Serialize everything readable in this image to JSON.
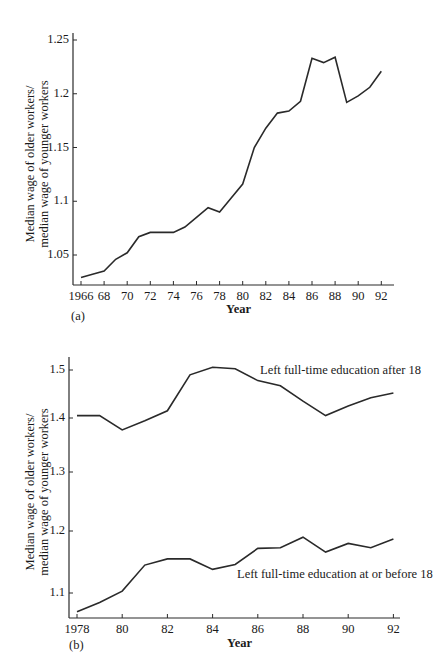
{
  "chart_data": [
    {
      "type": "line",
      "panel": "(a)",
      "title": "",
      "xlabel": "Year",
      "ylabel": "Median wage of older workers/ median wage of younger workers",
      "ylabel_lines": [
        "Median wage of older workers/",
        "median wage of younger workers"
      ],
      "x_ticks": [
        "1966",
        "68",
        "70",
        "72",
        "74",
        "76",
        "78",
        "80",
        "82",
        "84",
        "86",
        "88",
        "90",
        "92"
      ],
      "y_ticks": [
        "1.05",
        "1.1",
        "1.15",
        "1.2",
        "1.25"
      ],
      "xlim": [
        1965.5,
        1992.5
      ],
      "ylim": [
        1.022,
        1.255
      ],
      "grid": false,
      "x": [
        1966,
        1967,
        1968,
        1969,
        1970,
        1971,
        1972,
        1973,
        1974,
        1975,
        1976,
        1977,
        1978,
        1979,
        1980,
        1981,
        1982,
        1983,
        1984,
        1985,
        1986,
        1987,
        1988,
        1989,
        1990,
        1991,
        1992
      ],
      "series": [
        {
          "name": "All workers",
          "values": [
            1.029,
            1.032,
            1.035,
            1.046,
            1.052,
            1.067,
            1.071,
            1.071,
            1.071,
            1.076,
            1.085,
            1.094,
            1.09,
            1.103,
            1.116,
            1.15,
            1.168,
            1.182,
            1.184,
            1.193,
            1.233,
            1.229,
            1.234,
            1.192,
            1.198,
            1.206,
            1.221
          ]
        }
      ]
    },
    {
      "type": "line",
      "panel": "(b)",
      "title": "",
      "xlabel": "Year",
      "ylabel": "Median wage of older workers/ median wage of younger workers",
      "ylabel_lines": [
        "Median wage of older workers/",
        "median wage of younger workers"
      ],
      "x_ticks": [
        "1978",
        "80",
        "82",
        "84",
        "86",
        "88",
        "90",
        "92"
      ],
      "y_ticks": [
        "1.1",
        "1.2",
        "1.3",
        "1.4",
        "1.5"
      ],
      "xlim": [
        1977.8,
        1992.5
      ],
      "ylim": [
        1.06,
        1.52
      ],
      "grid": false,
      "x": [
        1978,
        1979,
        1980,
        1981,
        1982,
        1983,
        1984,
        1985,
        1986,
        1987,
        1988,
        1989,
        1990,
        1991,
        1992
      ],
      "series": [
        {
          "name": "Left full-time education after 18",
          "values": [
            1.405,
            1.405,
            1.378,
            1.395,
            1.415,
            1.49,
            1.506,
            1.503,
            1.478,
            1.467,
            1.435,
            1.405,
            1.425,
            1.442,
            1.452
          ]
        },
        {
          "name": "Left full-time education at or before 18",
          "values": [
            1.07,
            1.085,
            1.103,
            1.145,
            1.155,
            1.155,
            1.138,
            1.146,
            1.172,
            1.173,
            1.19,
            1.166,
            1.18,
            1.173,
            1.187
          ]
        }
      ],
      "annotations": [
        {
          "text": "Left full-time education after 18",
          "near": "upper series, right"
        },
        {
          "text": "Left full-time education at or before 18",
          "near": "below lower series, right"
        }
      ]
    }
  ],
  "labels": {
    "panel_a": "(a)",
    "panel_b": "(b)",
    "year": "Year",
    "ylabel_line1": "Median wage of older workers/",
    "ylabel_line2": "median wage of younger workers",
    "annot_upper": "Left full-time education after 18",
    "annot_lower": "Left full-time education at or before 18"
  },
  "colors": {
    "line": "#2a2a2a",
    "axis": "#2a2a2a",
    "text": "#1a1a1a",
    "background": "#ffffff"
  }
}
